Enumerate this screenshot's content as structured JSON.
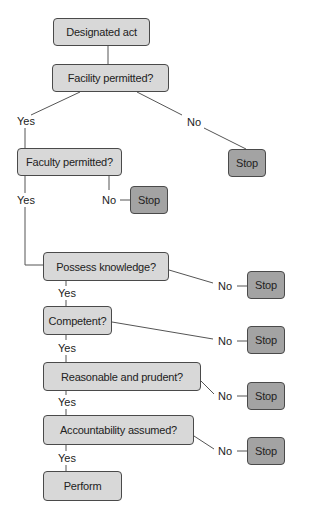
{
  "diagram": {
    "type": "flowchart",
    "colors": {
      "decision_fill": "#d8d8d8",
      "stop_fill": "#a3a3a3",
      "border": "#4a4a4a",
      "line": "#555555"
    },
    "nodes": {
      "start": "Designated act",
      "facility": "Facility permitted?",
      "faculty": "Faculty permitted?",
      "knowledge": "Possess knowledge?",
      "competent": "Competent?",
      "reasonable": "Reasonable and prudent?",
      "accountability": "Accountability assumed?",
      "perform": "Perform",
      "stop": "Stop"
    },
    "labels": {
      "yes": "Yes",
      "no": "No"
    },
    "edges": [
      {
        "from": "Designated act",
        "to": "Facility permitted?"
      },
      {
        "from": "Facility permitted?",
        "to": "Faculty permitted?",
        "label": "Yes"
      },
      {
        "from": "Facility permitted?",
        "to": "Stop",
        "label": "No"
      },
      {
        "from": "Faculty permitted?",
        "to": "Possess knowledge?",
        "label": "Yes"
      },
      {
        "from": "Faculty permitted?",
        "to": "Stop",
        "label": "No"
      },
      {
        "from": "Possess knowledge?",
        "to": "Competent?",
        "label": "Yes"
      },
      {
        "from": "Possess knowledge?",
        "to": "Stop",
        "label": "No"
      },
      {
        "from": "Competent?",
        "to": "Reasonable and prudent?",
        "label": "Yes"
      },
      {
        "from": "Competent?",
        "to": "Stop",
        "label": "No"
      },
      {
        "from": "Reasonable and prudent?",
        "to": "Accountability assumed?",
        "label": "Yes"
      },
      {
        "from": "Reasonable and prudent?",
        "to": "Stop",
        "label": "No"
      },
      {
        "from": "Accountability assumed?",
        "to": "Perform",
        "label": "Yes"
      },
      {
        "from": "Accountability assumed?",
        "to": "Stop",
        "label": "No"
      }
    ]
  }
}
